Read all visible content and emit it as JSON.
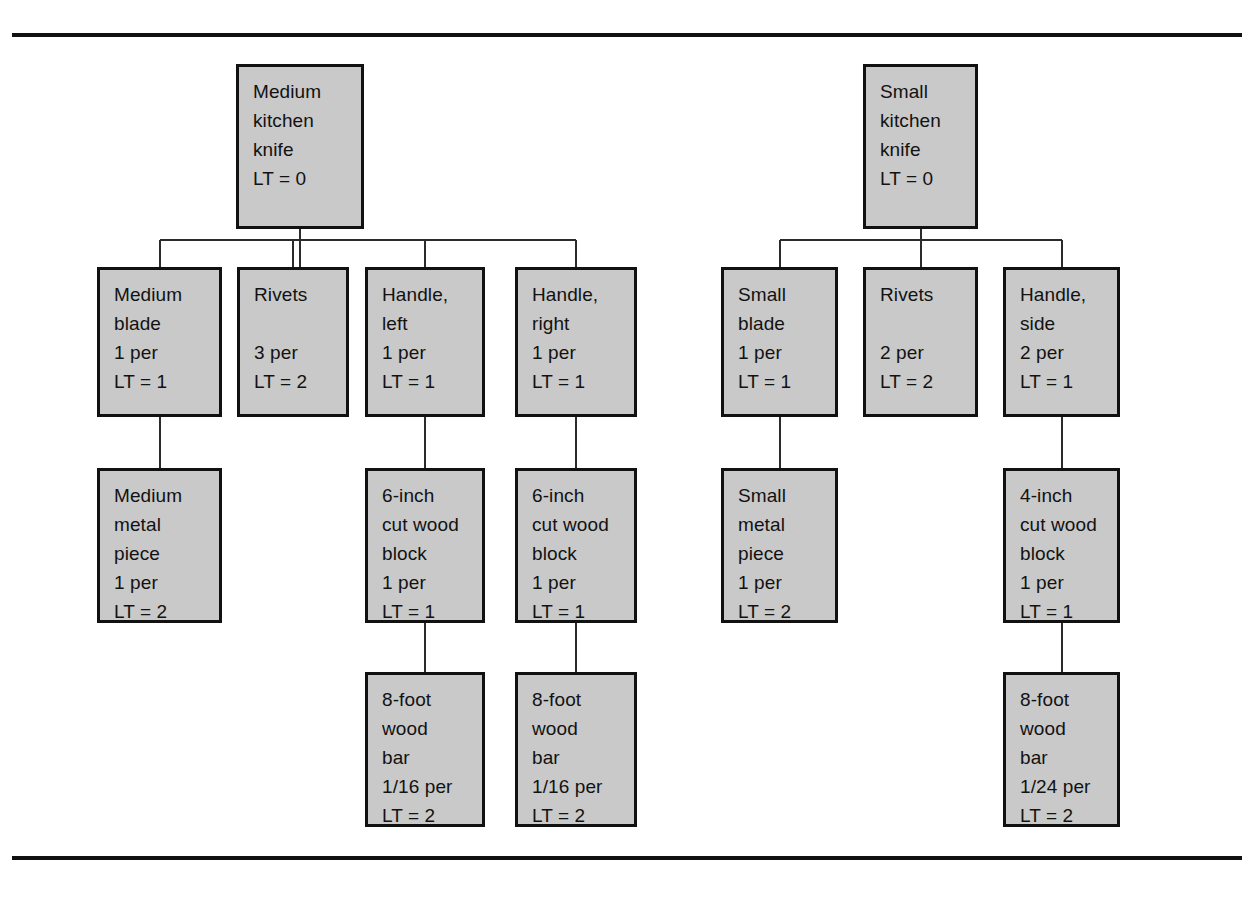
{
  "diagram": {
    "type": "bill-of-materials-tree",
    "box_fill_color": "#c9c9c9",
    "box_border_color": "#111111",
    "line_color": "#2b2b2b",
    "rules": {
      "top": "horizontal rule",
      "bottom": "horizontal rule"
    }
  },
  "trees": [
    {
      "name": "medium-kitchen-knife-tree",
      "root": {
        "id": "medium-kitchen-knife",
        "lines": [
          "Medium",
          "kitchen",
          "knife",
          "LT = 0"
        ],
        "item": "Medium kitchen knife",
        "lead_time": "LT = 0",
        "x": 236,
        "y": 64,
        "w": 128,
        "h": 165
      },
      "level2": [
        {
          "id": "medium-blade",
          "lines": [
            "Medium",
            "blade",
            "1 per",
            "LT = 1"
          ],
          "item": "Medium blade",
          "quantity": "1 per",
          "lead_time": "LT = 1",
          "x": 97,
          "y": 267,
          "w": 125,
          "h": 150
        },
        {
          "id": "rivets-medium",
          "lines": [
            "Rivets",
            "",
            "3 per",
            "LT = 2"
          ],
          "item": "Rivets",
          "quantity": "3 per",
          "lead_time": "LT = 2",
          "x": 237,
          "y": 267,
          "w": 112,
          "h": 150
        },
        {
          "id": "handle-left",
          "lines": [
            "Handle,",
            "left",
            "1 per",
            "LT = 1"
          ],
          "item": "Handle, left",
          "quantity": "1 per",
          "lead_time": "LT = 1",
          "x": 365,
          "y": 267,
          "w": 120,
          "h": 150
        },
        {
          "id": "handle-right",
          "lines": [
            "Handle,",
            "right",
            "1 per",
            "LT = 1"
          ],
          "item": "Handle, right",
          "quantity": "1 per",
          "lead_time": "LT = 1",
          "x": 515,
          "y": 267,
          "w": 122,
          "h": 150
        }
      ],
      "level3": [
        {
          "id": "medium-metal-piece",
          "lines": [
            "Medium",
            "metal",
            "piece",
            "1 per",
            "LT = 2"
          ],
          "item": "Medium metal piece",
          "quantity": "1 per",
          "lead_time": "LT = 2",
          "x": 97,
          "y": 468,
          "w": 125,
          "h": 155,
          "parent": "medium-blade"
        },
        {
          "id": "cut-wood-block-6-left",
          "lines": [
            "6-inch",
            "cut wood",
            "block",
            "1 per",
            "LT = 1"
          ],
          "item": "6-inch cut wood block",
          "quantity": "1 per",
          "lead_time": "LT = 1",
          "x": 365,
          "y": 468,
          "w": 120,
          "h": 155,
          "parent": "handle-left"
        },
        {
          "id": "cut-wood-block-6-right",
          "lines": [
            "6-inch",
            "cut wood",
            "block",
            "1 per",
            "LT = 1"
          ],
          "item": "6-inch cut wood block",
          "quantity": "1 per",
          "lead_time": "LT = 1",
          "x": 515,
          "y": 468,
          "w": 122,
          "h": 155,
          "parent": "handle-right"
        }
      ],
      "level4": [
        {
          "id": "wood-bar-8ft-left",
          "lines": [
            "8-foot",
            "wood",
            "bar",
            "1/16 per",
            "LT = 2"
          ],
          "item": "8-foot wood bar",
          "quantity": "1/16 per",
          "lead_time": "LT = 2",
          "x": 365,
          "y": 672,
          "w": 120,
          "h": 155,
          "parent": "cut-wood-block-6-left"
        },
        {
          "id": "wood-bar-8ft-right",
          "lines": [
            "8-foot",
            "wood",
            "bar",
            "1/16 per",
            "LT = 2"
          ],
          "item": "8-foot wood bar",
          "quantity": "1/16 per",
          "lead_time": "LT = 2",
          "x": 515,
          "y": 672,
          "w": 122,
          "h": 155,
          "parent": "cut-wood-block-6-right"
        }
      ]
    },
    {
      "name": "small-kitchen-knife-tree",
      "root": {
        "id": "small-kitchen-knife",
        "lines": [
          "Small",
          "kitchen",
          "knife",
          "LT = 0"
        ],
        "item": "Small kitchen knife",
        "lead_time": "LT = 0",
        "x": 863,
        "y": 64,
        "w": 115,
        "h": 165
      },
      "level2": [
        {
          "id": "small-blade",
          "lines": [
            "Small",
            "blade",
            "1 per",
            "LT = 1"
          ],
          "item": "Small blade",
          "quantity": "1 per",
          "lead_time": "LT = 1",
          "x": 721,
          "y": 267,
          "w": 117,
          "h": 150
        },
        {
          "id": "rivets-small",
          "lines": [
            "Rivets",
            "",
            "2 per",
            "LT = 2"
          ],
          "item": "Rivets",
          "quantity": "2 per",
          "lead_time": "LT = 2",
          "x": 863,
          "y": 267,
          "w": 115,
          "h": 150
        },
        {
          "id": "handle-side",
          "lines": [
            "Handle,",
            "side",
            "2 per",
            "LT = 1"
          ],
          "item": "Handle, side",
          "quantity": "2 per",
          "lead_time": "LT = 1",
          "x": 1003,
          "y": 267,
          "w": 117,
          "h": 150
        }
      ],
      "level3": [
        {
          "id": "small-metal-piece",
          "lines": [
            "Small",
            "metal",
            "piece",
            "1 per",
            "LT = 2"
          ],
          "item": "Small metal piece",
          "quantity": "1 per",
          "lead_time": "LT = 2",
          "x": 721,
          "y": 468,
          "w": 117,
          "h": 155,
          "parent": "small-blade"
        },
        {
          "id": "cut-wood-block-4",
          "lines": [
            "4-inch",
            "cut wood",
            "block",
            "1 per",
            "LT = 1"
          ],
          "item": "4-inch cut wood block",
          "quantity": "1 per",
          "lead_time": "LT = 1",
          "x": 1003,
          "y": 468,
          "w": 117,
          "h": 155,
          "parent": "handle-side"
        }
      ],
      "level4": [
        {
          "id": "wood-bar-8ft-small",
          "lines": [
            "8-foot",
            "wood",
            "bar",
            "1/24 per",
            "LT = 2"
          ],
          "item": "8-foot wood bar",
          "quantity": "1/24 per",
          "lead_time": "LT = 2",
          "x": 1003,
          "y": 672,
          "w": 117,
          "h": 155,
          "parent": "cut-wood-block-4"
        }
      ]
    }
  ]
}
